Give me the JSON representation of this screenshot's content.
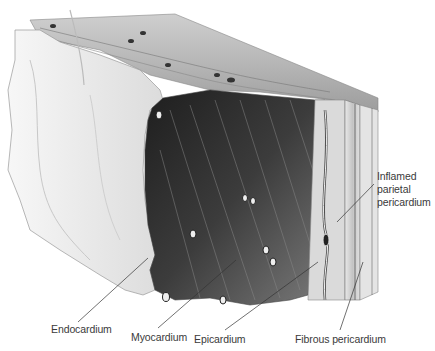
{
  "figure": {
    "colors": {
      "background": "#ffffff",
      "endocardium": "#eeeeee",
      "myocardium_dark": "#2b2b2b",
      "myocardium_mid": "#6e6e6e",
      "layers": "#d6d6d6",
      "label_text": "#3a3a3a",
      "leader_line": "#333333"
    }
  },
  "labels": {
    "inflamed_parietal_pericardium": {
      "lines": [
        "Inflamed",
        "parietal",
        "pericardium"
      ],
      "x": 377,
      "y": 172,
      "leader": {
        "x1": 374,
        "y1": 184,
        "x2": 337,
        "y2": 222
      }
    },
    "endocardium": {
      "text": "Endocardium",
      "x": 51,
      "y": 324,
      "leader": {
        "x1": 78,
        "y1": 322,
        "x2": 148,
        "y2": 258
      }
    },
    "myocardium": {
      "text": "Myocardium",
      "x": 131,
      "y": 332,
      "leader": {
        "x1": 158,
        "y1": 328,
        "x2": 236,
        "y2": 260
      }
    },
    "epicardium": {
      "text": "Epicardium",
      "x": 194,
      "y": 334,
      "leader": {
        "x1": 225,
        "y1": 330,
        "x2": 318,
        "y2": 262
      }
    },
    "fibrous_pericardium": {
      "text": "Fibrous pericardium",
      "x": 295,
      "y": 334,
      "leader": {
        "x1": 340,
        "y1": 330,
        "x2": 363,
        "y2": 262
      }
    }
  }
}
